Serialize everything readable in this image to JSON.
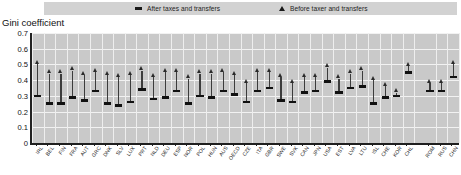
{
  "chart_data": {
    "type": "scatter",
    "title": "",
    "ylabel": "Gini coefficient",
    "xlabel": "",
    "ylim": [
      0,
      0.7
    ],
    "yticks": [
      "0",
      "0.1",
      "0.2",
      "0.3",
      "0.4",
      "0.5",
      "0.6",
      "0.7"
    ],
    "grid": true,
    "legend_position": "top",
    "legend": [
      {
        "name": "After taxes and transfers",
        "marker": "dash-marker"
      },
      {
        "name": "Before taxer and transfers",
        "marker": "triangle-marker"
      }
    ],
    "categories": [
      "IRL",
      "BEL",
      "FIN",
      "FRA",
      "AUT",
      "GRC",
      "DNK",
      "SLV",
      "LUX",
      "PRT",
      "NLD",
      "DEU",
      "ESP",
      "NOR",
      "POL",
      "HUN",
      "AUS",
      "OECD",
      "CZE",
      "ITA",
      "GBR",
      "SWE",
      "SVK",
      "CAN",
      "JPN",
      "USA",
      "EST",
      "LVA",
      "LTU",
      "ISL",
      "CHE",
      "KOR",
      "CHL",
      "ROM",
      "RUS",
      "CHN"
    ],
    "series": [
      {
        "name": "Before taxer and transfers",
        "marker": "triangle-marker",
        "values": [
          0.5,
          0.44,
          0.44,
          0.46,
          0.43,
          0.45,
          0.43,
          0.42,
          0.43,
          0.46,
          0.42,
          0.45,
          0.45,
          0.41,
          0.44,
          0.44,
          0.45,
          0.43,
          0.38,
          0.45,
          0.45,
          0.42,
          0.38,
          0.42,
          0.42,
          0.48,
          0.41,
          0.44,
          0.46,
          0.4,
          0.36,
          0.32,
          0.49,
          0.38,
          0.38,
          0.5
        ]
      },
      {
        "name": "After taxes and transfers",
        "marker": "dash-marker",
        "values": [
          0.3,
          0.25,
          0.25,
          0.29,
          0.27,
          0.33,
          0.25,
          0.24,
          0.26,
          0.34,
          0.28,
          0.29,
          0.33,
          0.25,
          0.3,
          0.29,
          0.33,
          0.31,
          0.26,
          0.33,
          0.35,
          0.27,
          0.26,
          0.32,
          0.33,
          0.39,
          0.32,
          0.35,
          0.36,
          0.25,
          0.29,
          0.3,
          0.45,
          0.33,
          0.33,
          0.42
        ]
      }
    ],
    "group_break_after_index": 32
  },
  "legend": {
    "after_label": "After taxes and transfers",
    "before_label": "Before taxer and transfers"
  },
  "axis": {
    "y_title": "Gini coefficient"
  }
}
